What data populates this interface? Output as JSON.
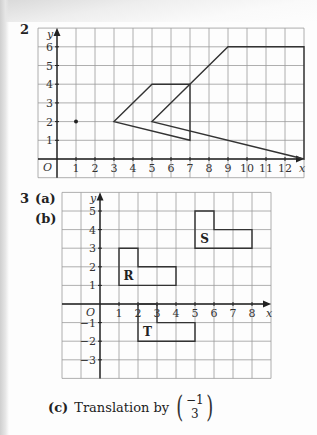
{
  "question2": {
    "number": "2",
    "graph": {
      "x_range": [
        -1,
        13
      ],
      "y_range": [
        -1,
        7
      ],
      "x_ticks": [
        "1",
        "2",
        "3",
        "4",
        "5",
        "6",
        "7",
        "8",
        "9",
        "10",
        "11",
        "12"
      ],
      "y_ticks": [
        "1",
        "2",
        "3",
        "4",
        "5",
        "6"
      ],
      "origin_label": "O",
      "x_axis_label": "x",
      "y_axis_label": "y",
      "point": [
        1,
        2
      ],
      "shapes": [
        {
          "name": "small-quadrilateral",
          "vertices": [
            [
              3,
              2
            ],
            [
              5,
              4
            ],
            [
              7,
              4
            ],
            [
              7,
              1
            ]
          ]
        },
        {
          "name": "large-quadrilateral",
          "vertices": [
            [
              5,
              2
            ],
            [
              9,
              6
            ],
            [
              13,
              6
            ],
            [
              13,
              0
            ]
          ]
        }
      ]
    }
  },
  "question3": {
    "number": "3",
    "part_a": "(a)",
    "part_b": "(b)",
    "graph": {
      "x_range": [
        -2,
        9
      ],
      "y_range": [
        -4,
        6
      ],
      "x_ticks": [
        "1",
        "2",
        "3",
        "4",
        "5",
        "6",
        "7",
        "8"
      ],
      "y_ticks_pos": [
        "1",
        "2",
        "3",
        "4",
        "5"
      ],
      "y_ticks_neg": [
        "-1",
        "-2",
        "-3"
      ],
      "origin_label": "O",
      "x_axis_label": "x",
      "y_axis_label": "y",
      "shapes": [
        {
          "label": "R",
          "vertices": [
            [
              1,
              1
            ],
            [
              1,
              3
            ],
            [
              2,
              3
            ],
            [
              2,
              2
            ],
            [
              4,
              2
            ],
            [
              4,
              1
            ]
          ]
        },
        {
          "label": "S",
          "vertices": [
            [
              5,
              3
            ],
            [
              5,
              5
            ],
            [
              6,
              5
            ],
            [
              6,
              4
            ],
            [
              8,
              4
            ],
            [
              8,
              3
            ]
          ]
        },
        {
          "label": "T",
          "vertices": [
            [
              2,
              0
            ],
            [
              3,
              0
            ],
            [
              3,
              -1
            ],
            [
              5,
              -1
            ],
            [
              5,
              -2
            ],
            [
              2,
              -2
            ]
          ]
        }
      ]
    },
    "part_c": {
      "label": "(c)",
      "text": "Translation by",
      "vector_top": "−1",
      "vector_bottom": "3"
    }
  }
}
